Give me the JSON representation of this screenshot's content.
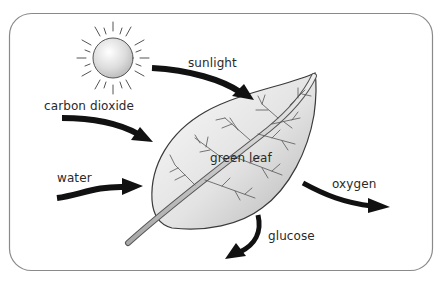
{
  "diagram": {
    "labels": {
      "sunlight": "sunlight",
      "carbon_dioxide": "carbon dioxide",
      "water": "water",
      "green_leaf": "green leaf",
      "oxygen": "oxygen",
      "glucose": "glucose"
    },
    "inputs": [
      "sunlight",
      "carbon dioxide",
      "water"
    ],
    "outputs": [
      "oxygen",
      "glucose"
    ],
    "colors": {
      "frame": "#8a8a8a",
      "arrow": "#111111",
      "leaf_fill_light": "#f4f4f4",
      "leaf_fill_dark": "#bdbdbd",
      "sun_fill": "#d9d9d9",
      "text": "#2a2a2a"
    }
  }
}
